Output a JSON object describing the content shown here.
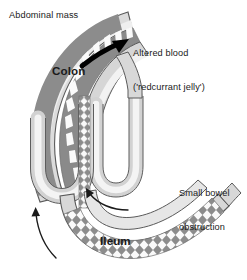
{
  "figure": {
    "background_color": "#ffffff"
  },
  "labels": {
    "abdominal_mass": "Abdominal mass",
    "altered_blood_line1": "Altered blood",
    "altered_blood_line2": "('redcurrant jelly')",
    "colon": "Colon",
    "small_bowel_line1": "Small bowel",
    "small_bowel_line2": "obstruction",
    "ileum": "Ileum"
  },
  "colors": {
    "outline": "#4a4a4a",
    "bowel_wall": "#d2d2d2",
    "bowel_wall_light": "#e2e2e2",
    "lumen_dark": "#8c8c8c",
    "lumen_mid": "#9a9a9a",
    "mucosa_white": "#fafafa",
    "arrow_black": "#000000",
    "text": "#1a1a1a",
    "background": "#ffffff"
  },
  "arrows": {
    "altered_blood_arrow": "thick-black-arrow-pointing-upper-right",
    "peristalsis_outer_arrow": "thin-curved-arrow-pointing-up",
    "peristalsis_inner_arrow": "thin-curved-arrow-pointing-upper-right"
  }
}
